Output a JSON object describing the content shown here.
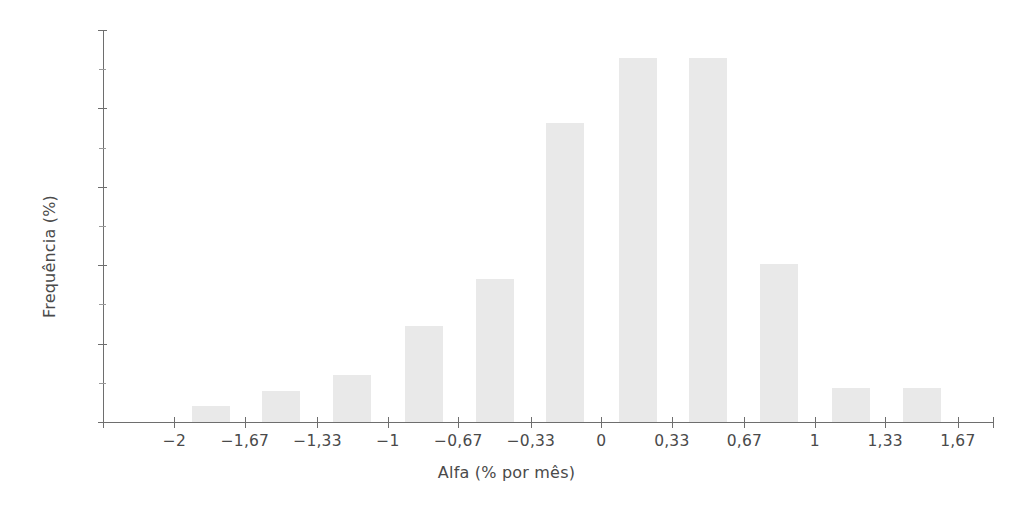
{
  "chart_data": {
    "type": "bar",
    "title": "",
    "subtitle": "",
    "xlabel": "Alfa (% por mês)",
    "ylabel": "Frequência (%)",
    "xlim": [
      -2.335,
      1.835
    ],
    "ylim": [
      0,
      25
    ],
    "grid": false,
    "legend": null,
    "x_tick_labels": [
      "-2",
      "-1,67",
      "-1,33",
      "-1",
      "-0,67",
      "-0,33",
      "0",
      "0,33",
      "0,67",
      "1",
      "1,33",
      "1,67"
    ],
    "x_tick_values": [
      -2,
      -1.67,
      -1.33,
      -1,
      -0.67,
      -0.33,
      0,
      0.33,
      0.67,
      1,
      1.33,
      1.67
    ],
    "y_tick_labels": [
      "0",
      "5",
      "10",
      "15",
      "20",
      "25"
    ],
    "y_tick_values": [
      0,
      5,
      10,
      15,
      20,
      25
    ],
    "y_minor_tick_values": [
      2.5,
      7.5,
      12.5,
      17.5,
      22.5
    ],
    "bar_color": "#e9e9e9",
    "axis_color": "#6e6e6e",
    "text_color": "#4a4a4a",
    "bar_width_value": 0.18,
    "categories": [
      -1.83,
      -1.5,
      -1.17,
      -0.83,
      -0.5,
      -0.17,
      0.17,
      0.5,
      0.83,
      1.17,
      1.5
    ],
    "values": [
      1.0,
      2.0,
      3.0,
      6.1,
      9.1,
      19.1,
      23.2,
      23.2,
      10.1,
      2.2,
      2.2
    ],
    "bars": [
      {
        "center": -1.83,
        "value": 1.0,
        "label": "-1,83"
      },
      {
        "center": -1.5,
        "value": 2.0,
        "label": "-1,5"
      },
      {
        "center": -1.17,
        "value": 3.0,
        "label": "-1,17"
      },
      {
        "center": -0.83,
        "value": 6.1,
        "label": "-0,83"
      },
      {
        "center": -0.5,
        "value": 9.1,
        "label": "-0,5"
      },
      {
        "center": -0.17,
        "value": 19.1,
        "label": "-0,17"
      },
      {
        "center": 0.17,
        "value": 23.2,
        "label": "0,17"
      },
      {
        "center": 0.5,
        "value": 23.2,
        "label": "0,5"
      },
      {
        "center": 0.83,
        "value": 10.1,
        "label": "0,83"
      },
      {
        "center": 1.17,
        "value": 2.2,
        "label": "1,17"
      },
      {
        "center": 1.5,
        "value": 2.2,
        "label": "1,5"
      }
    ]
  }
}
